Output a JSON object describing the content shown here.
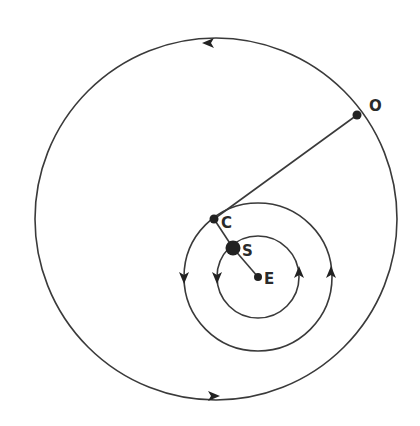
{
  "diagram": {
    "colors": {
      "stroke": "#3a3a3a",
      "point": "#222222",
      "background": "#ffffff"
    },
    "outer_circle": {
      "cx": 216,
      "cy": 219,
      "r": 181,
      "direction": "counterclockwise"
    },
    "middle_circle": {
      "cx": 258,
      "cy": 277,
      "r": 74,
      "direction": "counterclockwise"
    },
    "inner_circle": {
      "cx": 258,
      "cy": 277,
      "r": 41,
      "direction": "counterclockwise"
    },
    "points": [
      {
        "id": "O",
        "label": "O",
        "x": 357,
        "y": 115,
        "r": 4.5,
        "label_x": 369,
        "label_y": 111
      },
      {
        "id": "C",
        "label": "C",
        "x": 214,
        "y": 219,
        "r": 4.5,
        "label_x": 221,
        "label_y": 228
      },
      {
        "id": "S",
        "label": "S",
        "x": 233,
        "y": 248,
        "r": 7.5,
        "label_x": 242,
        "label_y": 256
      },
      {
        "id": "E",
        "label": "E",
        "x": 258,
        "y": 277,
        "r": 4,
        "label_x": 264,
        "label_y": 284
      }
    ],
    "segments": [
      {
        "from": "O",
        "to": "C"
      },
      {
        "from": "C",
        "to": "S"
      },
      {
        "from": "S",
        "to": "E"
      }
    ],
    "arrows": [
      {
        "on": "outer_circle",
        "x": 208,
        "y": 43,
        "dir": "left"
      },
      {
        "on": "outer_circle",
        "x": 214,
        "y": 396,
        "dir": "right"
      },
      {
        "on": "middle_circle",
        "x": 184,
        "y": 278,
        "dir": "down"
      },
      {
        "on": "middle_circle",
        "x": 331,
        "y": 272,
        "dir": "up"
      },
      {
        "on": "inner_circle",
        "x": 217,
        "y": 278,
        "dir": "down"
      },
      {
        "on": "inner_circle",
        "x": 299,
        "y": 272,
        "dir": "up"
      }
    ]
  }
}
